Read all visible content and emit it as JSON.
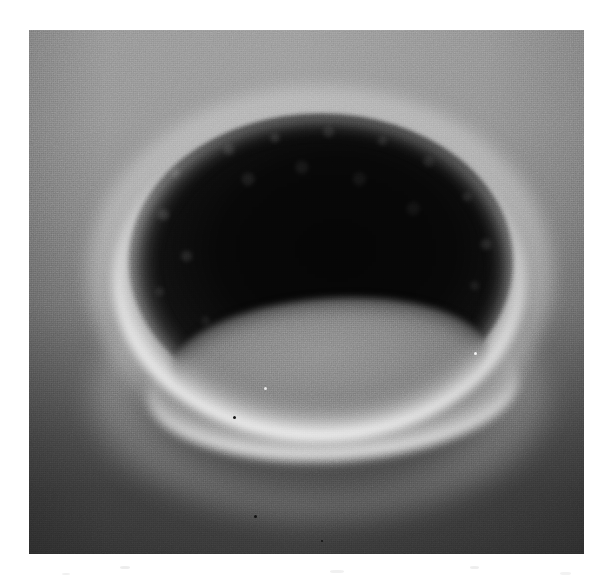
{
  "page": {
    "background_color": "#ffffff",
    "width": 612,
    "height": 582
  },
  "figure": {
    "type": "scanning-electron-micrograph",
    "caption": "",
    "label": "",
    "scale_bar_text": "",
    "magnification_text": "",
    "panel": {
      "left": 29,
      "top": 30,
      "width": 555,
      "height": 524,
      "border": "none"
    },
    "subject": {
      "name": "crater-cavity",
      "description": "elliptical pit with bright illuminated rim and dark interior cavity",
      "center_x": 330,
      "center_y": 300,
      "outer_width": 430,
      "outer_height": 330
    },
    "tones": {
      "background_top": "#9a9a9a",
      "background_bottom": "#343434",
      "cavity_dark": "#070707",
      "rim_highlight": "#ffffff",
      "crater_floor": "#878787"
    },
    "features": [
      {
        "name": "bright-rim-crescent",
        "description": "specular white lip along lower-left and bottom of crater"
      },
      {
        "name": "cavity-void",
        "description": "near-black overhung interior of the pit"
      },
      {
        "name": "granular-wall",
        "description": "rough textured upper and left inner wall"
      },
      {
        "name": "crater-floor",
        "description": "mid-grey lens-shaped floor visible in the lower half"
      },
      {
        "name": "outer-halo",
        "description": "diffuse bright glow on the surface around the pit opening"
      }
    ],
    "specks": [
      {
        "name": "bright-speck-right-wall",
        "x": 474,
        "y": 352,
        "size": 3,
        "tone": "#f2f2f2"
      },
      {
        "name": "bright-speck-floor",
        "x": 264,
        "y": 387,
        "size": 3,
        "tone": "#e8e8e8"
      },
      {
        "name": "dark-speck-floor",
        "x": 233,
        "y": 416,
        "size": 3,
        "tone": "#111111"
      },
      {
        "name": "dark-speck-lower-surface",
        "x": 254,
        "y": 515,
        "size": 3,
        "tone": "#111111"
      },
      {
        "name": "dark-speck-bottom",
        "x": 321,
        "y": 540,
        "size": 2,
        "tone": "#0f0f0f"
      }
    ]
  }
}
